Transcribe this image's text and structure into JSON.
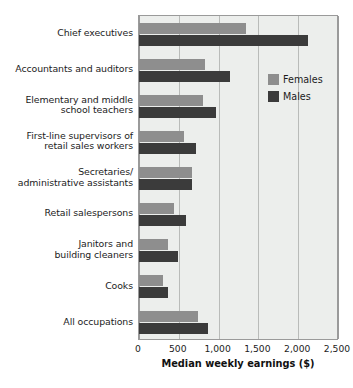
{
  "chart_data": {
    "type": "bar",
    "orientation": "horizontal",
    "title": "",
    "xlabel": "Median weekly earnings ($)",
    "ylabel": "",
    "xlim": [
      0,
      2500
    ],
    "xticks": [
      0,
      500,
      1000,
      1500,
      2000,
      2500
    ],
    "xtick_labels": [
      "0",
      "500",
      "1,000",
      "1,500",
      "2,000",
      "2,500"
    ],
    "grid": true,
    "legend_position": "upper right",
    "categories": [
      "Chief executives",
      "Accountants and auditors",
      "Elementary and middle school teachers",
      "First-line supervisors of retail sales workers",
      "Secretaries/ administrative assistants",
      "Retail salespersons",
      "Janitors and building cleaners",
      "Cooks",
      "All occupations"
    ],
    "category_lines": [
      [
        "Chief executives"
      ],
      [
        "Accountants and auditors"
      ],
      [
        "Elementary and middle",
        "school teachers"
      ],
      [
        "First-line supervisors of",
        "retail sales workers"
      ],
      [
        "Secretaries/",
        "administrative assistants"
      ],
      [
        "Retail salespersons"
      ],
      [
        "Janitors and",
        "building cleaners"
      ],
      [
        "Cooks"
      ],
      [
        "All occupations"
      ]
    ],
    "series": [
      {
        "name": "Females",
        "color": "#8e8e8e",
        "values": [
          1350,
          830,
          810,
          560,
          660,
          440,
          360,
          305,
          745
        ]
      },
      {
        "name": "Males",
        "color": "#3b3b3b",
        "values": [
          2120,
          1140,
          970,
          715,
          670,
          585,
          495,
          370,
          870
        ]
      }
    ]
  },
  "legend": {
    "items": [
      {
        "label": "Females",
        "swatch": "females"
      },
      {
        "label": "Males",
        "swatch": "males"
      }
    ]
  }
}
